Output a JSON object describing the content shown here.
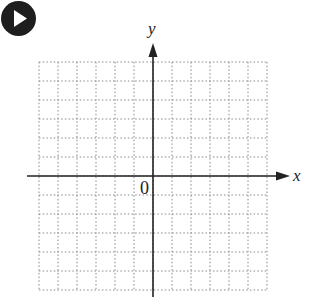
{
  "controls": {
    "play_button": {
      "icon": "play-icon",
      "color": "#1e1e1e"
    }
  },
  "graph": {
    "type": "coordinate-plane",
    "x_axis_label": "x",
    "y_axis_label": "y",
    "origin_label": "0",
    "grid": {
      "columns": 12,
      "rows": 12,
      "cell_px": 19,
      "left": 39,
      "top": 62,
      "line_style": "dotted",
      "line_color": "#888888"
    },
    "axes_color": "#222222"
  }
}
